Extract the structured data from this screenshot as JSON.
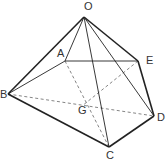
{
  "figure": {
    "type": "pyramid",
    "vertices": {
      "O": {
        "label": "O"
      },
      "A": {
        "label": "A"
      },
      "B": {
        "label": "B"
      },
      "C": {
        "label": "C"
      },
      "D": {
        "label": "D"
      },
      "E": {
        "label": "E"
      },
      "G": {
        "label": "G"
      }
    },
    "solid_edges": [
      [
        "O",
        "B"
      ],
      [
        "O",
        "A"
      ],
      [
        "O",
        "E"
      ],
      [
        "O",
        "C"
      ],
      [
        "O",
        "D"
      ],
      [
        "A",
        "B"
      ],
      [
        "A",
        "E"
      ],
      [
        "E",
        "D"
      ],
      [
        "B",
        "C"
      ],
      [
        "C",
        "D"
      ]
    ],
    "dashed_edges": [
      [
        "A",
        "C"
      ],
      [
        "E",
        "G"
      ],
      [
        "B",
        "D"
      ]
    ],
    "line_color": "#222222"
  }
}
